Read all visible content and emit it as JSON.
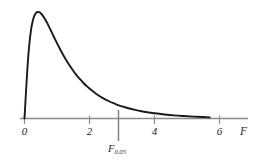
{
  "chart_data": {
    "type": "line",
    "title": "",
    "subtitle": "",
    "xlabel": "F",
    "ylabel": "",
    "xlim": [
      -0.15,
      7.05
    ],
    "ylim": [
      0,
      1.06
    ],
    "grid": false,
    "legend": null,
    "x_ticks": [
      {
        "value": 0,
        "label": "0"
      },
      {
        "value": 2,
        "label": "2"
      },
      {
        "value": 4,
        "label": "4"
      },
      {
        "value": 6,
        "label": "6"
      }
    ],
    "y_ticks": [],
    "series": [
      {
        "name": "F density curve",
        "color": "#1a1a1a",
        "x": [
          0.0,
          0.05,
          0.1,
          0.15,
          0.2,
          0.25,
          0.3,
          0.35,
          0.4,
          0.45,
          0.5,
          0.55,
          0.6,
          0.65,
          0.7,
          0.8,
          0.9,
          1.0,
          1.1,
          1.2,
          1.3,
          1.4,
          1.5,
          1.6,
          1.7,
          1.8,
          1.9,
          2.0,
          2.2,
          2.4,
          2.6,
          2.8,
          2.9,
          3.0,
          3.2,
          3.4,
          3.6,
          3.8,
          4.0,
          4.3,
          4.6,
          4.9,
          5.2,
          5.5,
          5.7
        ],
        "y": [
          0.0,
          0.27,
          0.52,
          0.7,
          0.83,
          0.91,
          0.963,
          0.99,
          1.0,
          0.998,
          0.988,
          0.971,
          0.949,
          0.923,
          0.895,
          0.833,
          0.77,
          0.707,
          0.648,
          0.592,
          0.54,
          0.492,
          0.448,
          0.408,
          0.371,
          0.338,
          0.308,
          0.281,
          0.233,
          0.194,
          0.162,
          0.136,
          0.124,
          0.114,
          0.096,
          0.081,
          0.068,
          0.058,
          0.049,
          0.038,
          0.029,
          0.023,
          0.018,
          0.014,
          0.011
        ]
      }
    ],
    "annotations": [
      {
        "name": "critical-value-line",
        "type": "vline",
        "x_value": 2.9,
        "label": "F",
        "label_subscript": "0.05",
        "color": "#7a7a7a"
      }
    ],
    "axis_color": "#8c8c8c",
    "curve_color": "#1a1a1a",
    "text_color": "#231f20",
    "background": "#ffffff"
  }
}
